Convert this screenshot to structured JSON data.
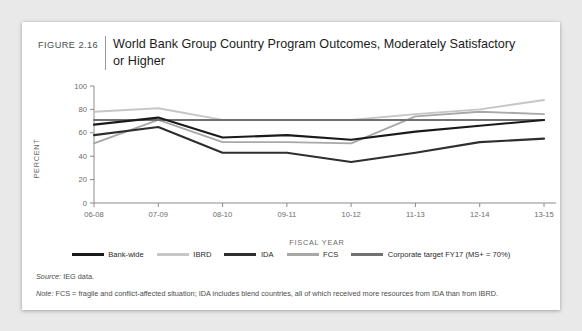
{
  "figure": {
    "number_label": "FIGURE 2.16",
    "title": "World Bank Group Country Program Outcomes, Moderately Satisfactory or Higher",
    "source": "Source: IEG data.",
    "source_prefix": "Source:",
    "source_text": " IEG data.",
    "note_prefix": "Note:",
    "note_text": " FCS = fragile and conflict-affected situation; IDA includes blend countries, all of which received more resources from IDA than from IBRD."
  },
  "colors": {
    "background": "#e9e9e9",
    "card": "#ffffff",
    "axis": "#8c8c8c",
    "tick_text": "#6b6b6b",
    "bank_wide": "#1a1a1a",
    "ibrd": "#c6c6c6",
    "ida": "#2e2e2e",
    "fcs": "#a8a8a8",
    "corporate_target": "#717171"
  },
  "chart_data": {
    "type": "line",
    "title": "World Bank Group Country Program Outcomes, Moderately Satisfactory or Higher",
    "xlabel": "FISCAL YEAR",
    "ylabel": "PERCENT",
    "ylim": [
      0,
      100
    ],
    "yticks": [
      0,
      20,
      40,
      60,
      80,
      100
    ],
    "grid": false,
    "legend_position": "bottom",
    "categories": [
      "06-08",
      "07-09",
      "08-10",
      "09-11",
      "10-12",
      "11-13",
      "12-14",
      "13-15"
    ],
    "series": [
      {
        "name": "Bank-wide",
        "color": "#1a1a1a",
        "values": [
          67,
          73,
          56,
          58,
          54,
          61,
          66,
          71
        ]
      },
      {
        "name": "IBRD",
        "color": "#c6c6c6",
        "values": [
          78,
          81,
          71,
          71,
          71,
          76,
          80,
          88
        ]
      },
      {
        "name": "IDA",
        "color": "#2e2e2e",
        "values": [
          58,
          65,
          43,
          43,
          35,
          43,
          52,
          55
        ]
      },
      {
        "name": "FCS",
        "color": "#a8a8a8",
        "values": [
          51,
          71,
          52,
          52,
          51,
          74,
          78,
          76
        ]
      },
      {
        "name": "Corporate target FY17 (MS+ = 70%)",
        "color": "#717171",
        "values": [
          71,
          71,
          71,
          71,
          71,
          71,
          71,
          71
        ]
      }
    ]
  }
}
